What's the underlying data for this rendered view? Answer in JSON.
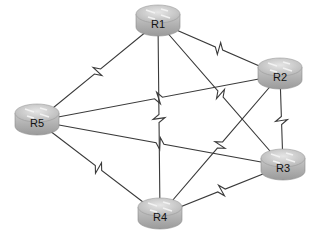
{
  "diagram": {
    "type": "network-topology",
    "routers": [
      {
        "id": "R1",
        "label": "R1",
        "x": 158,
        "y": 22
      },
      {
        "id": "R2",
        "label": "R2",
        "x": 280,
        "y": 75
      },
      {
        "id": "R3",
        "label": "R3",
        "x": 283,
        "y": 166
      },
      {
        "id": "R4",
        "label": "R4",
        "x": 160,
        "y": 215
      },
      {
        "id": "R5",
        "label": "R5",
        "x": 37,
        "y": 121
      }
    ],
    "links": [
      {
        "from": "R1",
        "to": "R5",
        "type": "serial"
      },
      {
        "from": "R1",
        "to": "R2",
        "type": "serial"
      },
      {
        "from": "R1",
        "to": "R3",
        "type": "serial"
      },
      {
        "from": "R1",
        "to": "R4",
        "type": "serial"
      },
      {
        "from": "R2",
        "to": "R5",
        "type": "serial"
      },
      {
        "from": "R2",
        "to": "R3",
        "type": "serial"
      },
      {
        "from": "R2",
        "to": "R4",
        "type": "serial"
      },
      {
        "from": "R5",
        "to": "R3",
        "type": "serial"
      },
      {
        "from": "R5",
        "to": "R4",
        "type": "serial"
      },
      {
        "from": "R4",
        "to": "R3",
        "type": "serial"
      }
    ],
    "colors": {
      "router_body": "#b8b8b8",
      "router_top": "#d4d4d4",
      "link": "#3a3a3a"
    }
  }
}
